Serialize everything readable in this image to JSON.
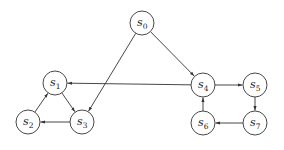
{
  "diagram": {
    "type": "directed-graph",
    "nodes": [
      {
        "id": "s0",
        "letter": "s",
        "sub": "0",
        "x": 142,
        "y": 23
      },
      {
        "id": "s1",
        "letter": "s",
        "sub": "1",
        "x": 55,
        "y": 83
      },
      {
        "id": "s2",
        "letter": "s",
        "sub": "2",
        "x": 28,
        "y": 122
      },
      {
        "id": "s3",
        "letter": "s",
        "sub": "3",
        "x": 82,
        "y": 122
      },
      {
        "id": "s4",
        "letter": "s",
        "sub": "4",
        "x": 203,
        "y": 85
      },
      {
        "id": "s5",
        "letter": "s",
        "sub": "5",
        "x": 255,
        "y": 85
      },
      {
        "id": "s6",
        "letter": "s",
        "sub": "6",
        "x": 203,
        "y": 123
      },
      {
        "id": "s7",
        "letter": "s",
        "sub": "7",
        "x": 255,
        "y": 123
      }
    ],
    "edges": [
      {
        "from": "s0",
        "to": "s3"
      },
      {
        "from": "s0",
        "to": "s4"
      },
      {
        "from": "s4",
        "to": "s1"
      },
      {
        "from": "s1",
        "to": "s3"
      },
      {
        "from": "s2",
        "to": "s1"
      },
      {
        "from": "s3",
        "to": "s2"
      },
      {
        "from": "s4",
        "to": "s5"
      },
      {
        "from": "s5",
        "to": "s7"
      },
      {
        "from": "s7",
        "to": "s6"
      },
      {
        "from": "s6",
        "to": "s4"
      }
    ],
    "node_radius": 12,
    "colors": {
      "stroke": "#333333",
      "fill": "#ffffff",
      "text": "#222222"
    }
  }
}
